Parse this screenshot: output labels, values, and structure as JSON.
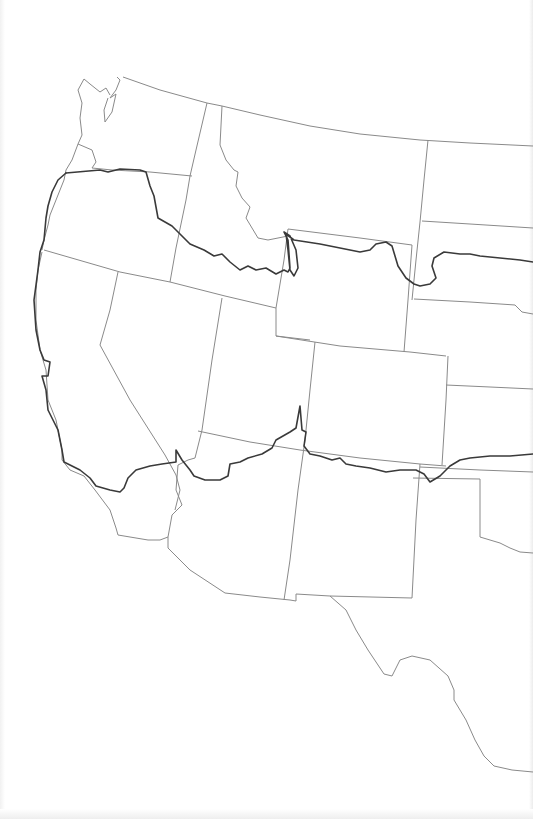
{
  "map": {
    "type": "outline-map",
    "region": "Western United States",
    "colors": {
      "background": "#ffffff",
      "state_border": "#8a8a8a",
      "route_line": "#3a3a3a"
    },
    "states_visible": [
      "Washington",
      "Oregon",
      "California",
      "Idaho",
      "Nevada",
      "Montana",
      "Wyoming",
      "Utah",
      "Arizona",
      "Colorado",
      "New Mexico",
      "North Dakota",
      "South Dakota",
      "Nebraska",
      "Kansas",
      "Oklahoma",
      "Texas"
    ],
    "labels": []
  }
}
